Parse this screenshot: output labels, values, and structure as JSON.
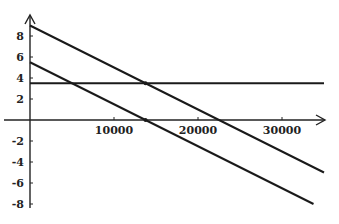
{
  "chart_data": {
    "type": "line",
    "title": "",
    "xlabel": "",
    "ylabel": "",
    "xlim": [
      0,
      36000
    ],
    "ylim": [
      -8,
      9.5
    ],
    "grid": false,
    "legend": null,
    "x_ticks": [
      10000,
      20000,
      30000
    ],
    "x_tick_labels": [
      "10000",
      "20000",
      "30000"
    ],
    "y_ticks": [
      8,
      6,
      4,
      2,
      -2,
      -4,
      -6,
      -8
    ],
    "y_tick_labels": [
      "8",
      "6",
      "4",
      "2",
      "-2",
      "-4",
      "-6",
      "-8"
    ],
    "series": [
      {
        "name": "upper line",
        "x": [
          0,
          35000
        ],
        "y": [
          9,
          -5
        ]
      },
      {
        "name": "horizontal line",
        "x": [
          0,
          35000
        ],
        "y": [
          3.5,
          3.5
        ]
      },
      {
        "name": "lower line",
        "x": [
          0,
          33750
        ],
        "y": [
          5.5,
          -8
        ]
      }
    ],
    "markers": [
      {
        "x": 13750,
        "y": 3.5
      },
      {
        "x": 13750,
        "y": 0
      }
    ]
  },
  "colors": {
    "line": "#1a1a1a",
    "background": "#ffffff"
  }
}
